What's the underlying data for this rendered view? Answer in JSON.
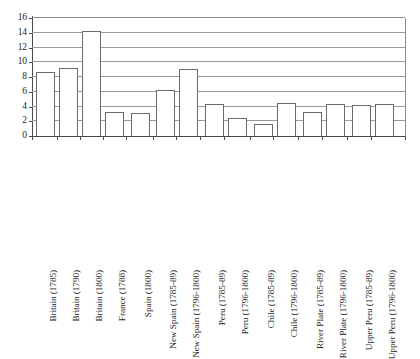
{
  "chart_data": {
    "type": "bar",
    "title": "",
    "subtitle": "",
    "xlabel": "",
    "ylabel": "",
    "ylim": [
      0,
      16
    ],
    "ytick_step": 2,
    "yticks": [
      0,
      2,
      4,
      6,
      8,
      10,
      12,
      14,
      16
    ],
    "ytick_labels": [
      "0",
      "2",
      "4",
      "6",
      "8",
      "10",
      "12",
      "14",
      "16"
    ],
    "grid": true,
    "grid_axis": "y",
    "legend": false,
    "legend_position": "none",
    "orientation": "vertical",
    "bar_fill": "#ffffff",
    "bar_edge": "#6b6b6b",
    "categories": [
      "Britain (1785)",
      "Britain (1790)",
      "Britain (1800)",
      "France (1788)",
      "Spain (1800)",
      "New Spain (1785-89)",
      "New Spain (1796-1800)",
      "Peru (1785-89)",
      "Peru (1796-1800)",
      "Chile (1785-89)",
      "Chile (1796-1800)",
      "River Plate (1785-89)",
      "River Plate (1796-1800)",
      "Upper Peru (1785-89)",
      "Upper Peru (1796-1800)"
    ],
    "values": [
      8.7,
      9.2,
      14.2,
      3.2,
      3.1,
      6.2,
      9.1,
      4.4,
      2.4,
      1.6,
      4.5,
      3.3,
      4.3,
      4.2,
      4.3
    ],
    "bar_positions": [
      {
        "label": "Britain (1785)",
        "value": 8.7,
        "left_px": 4,
        "width_px": 19,
        "tick_px": 0
      },
      {
        "label": "Britain (1790)",
        "value": 9.2,
        "left_px": 27,
        "width_px": 19,
        "tick_px": 25
      },
      {
        "label": "Britain (1800)",
        "value": 14.2,
        "left_px": 50,
        "width_px": 19,
        "tick_px": 48
      },
      {
        "label": "France (1788)",
        "value": 3.2,
        "left_px": 73,
        "width_px": 19,
        "tick_px": 71
      },
      {
        "label": "Spain (1800)",
        "value": 3.1,
        "left_px": 99,
        "width_px": 19,
        "tick_px": 94
      },
      {
        "label": "New Spain (1785-89)",
        "value": 6.2,
        "left_px": 124,
        "width_px": 19,
        "tick_px": 121
      },
      {
        "label": "New Spain (1796-1800)",
        "value": 9.1,
        "left_px": 147,
        "width_px": 19,
        "tick_px": 144
      },
      {
        "label": "Peru (1785-89)",
        "value": 4.4,
        "left_px": 173,
        "width_px": 19,
        "tick_px": 168
      },
      {
        "label": "Peru (1796-1800)",
        "value": 2.4,
        "left_px": 196,
        "width_px": 19,
        "tick_px": 192
      },
      {
        "label": "Chile (1785-89)",
        "value": 1.6,
        "left_px": 222,
        "width_px": 19,
        "tick_px": 218
      },
      {
        "label": "Chile (1796-1800)",
        "value": 4.5,
        "left_px": 245,
        "width_px": 19,
        "tick_px": 241
      },
      {
        "label": "River Plate (1785-89)",
        "value": 3.3,
        "left_px": 271,
        "width_px": 19,
        "tick_px": 266
      },
      {
        "label": "River Plate (1796-1800)",
        "value": 4.3,
        "left_px": 294,
        "width_px": 19,
        "tick_px": 290
      },
      {
        "label": "Upper Peru (1785-89)",
        "value": 4.2,
        "left_px": 320,
        "width_px": 19,
        "tick_px": 315
      },
      {
        "label": "Upper Peru (1796-1800)",
        "value": 4.3,
        "left_px": 343,
        "width_px": 19,
        "tick_px": 339
      }
    ]
  }
}
